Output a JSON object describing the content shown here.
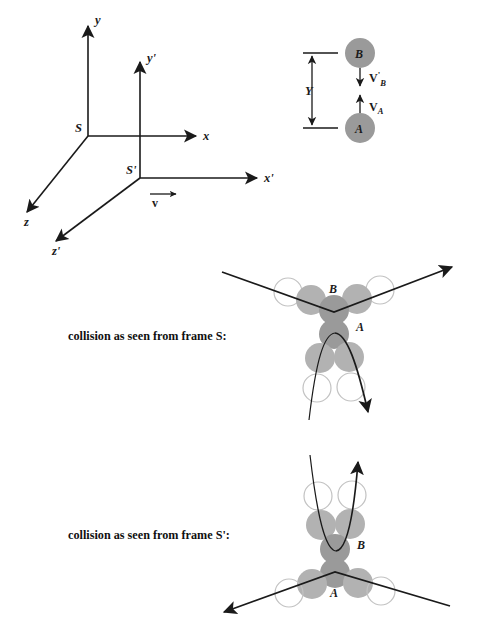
{
  "figure": {
    "background": "#ffffff",
    "ink_color": "#1a1a1a",
    "ball_fill_dark": "#9a9a9a",
    "ball_fill_mid": "#a8a8a8",
    "ball_fill_light": "#b8b8b8",
    "ghost_stroke": "#c2c2c2"
  },
  "frames_diagram": {
    "frame_s": {
      "origin_label": "S",
      "axis_x_label": "x",
      "axis_y_label": "y",
      "axis_z_label": "z"
    },
    "frame_s_prime": {
      "origin_label": "S'",
      "axis_x_label": "x'",
      "axis_y_label": "y'",
      "axis_z_label": "z'",
      "velocity_label": "v"
    }
  },
  "balls_setup": {
    "ball_top_label": "B",
    "ball_bottom_label": "A",
    "separation_label": "Y",
    "velocity_top_base": "V",
    "velocity_top_prime": "'",
    "velocity_top_sub": "B",
    "velocity_bottom_base": "V",
    "velocity_bottom_sub": "A"
  },
  "collision_s": {
    "caption": "collision as seen from frame S:",
    "ball_upper_label": "B",
    "ball_lower_label": "A"
  },
  "collision_s_prime": {
    "caption": "collision as seen from frame S':",
    "ball_upper_label": "B",
    "ball_lower_label": "A"
  }
}
